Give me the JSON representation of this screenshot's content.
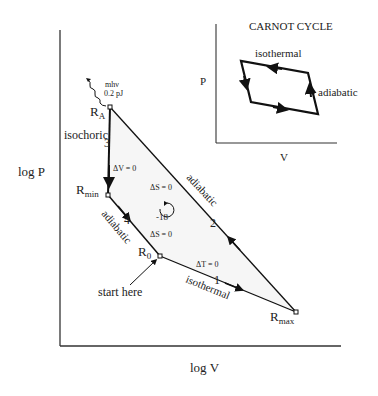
{
  "main_plot": {
    "x_axis_label": "log  V",
    "y_axis_label": "log  P",
    "photon_label_line1": "mhν",
    "photon_label_line2": "0.2 pJ",
    "points": {
      "RA": {
        "main": "R",
        "sub": "A"
      },
      "Rmin": {
        "main": "R",
        "sub": "min"
      },
      "R0": {
        "main": "R",
        "sub": "0"
      },
      "Rmax": {
        "main": "R",
        "sub": "max"
      }
    },
    "step_numbers": [
      "1",
      "2",
      "3",
      "4"
    ],
    "labels": {
      "isochoric": "isochoric",
      "dV": "ΔV = 0",
      "dS_upper": "ΔS = 0",
      "dS_lower": "ΔS = 0",
      "dT": "ΔT = 0",
      "adiabatic_upper": "adiabatic",
      "adiabatic_lower": "adiabatic",
      "isothermal": "isothermal",
      "start_here": "start  here",
      "cycle_marker": "-18"
    }
  },
  "inset": {
    "title": "CARNOT CYCLE",
    "x_axis_label": "V",
    "y_axis_label": "P",
    "label_isothermal": "isothermal",
    "label_adiabatic": "adiabatic"
  }
}
